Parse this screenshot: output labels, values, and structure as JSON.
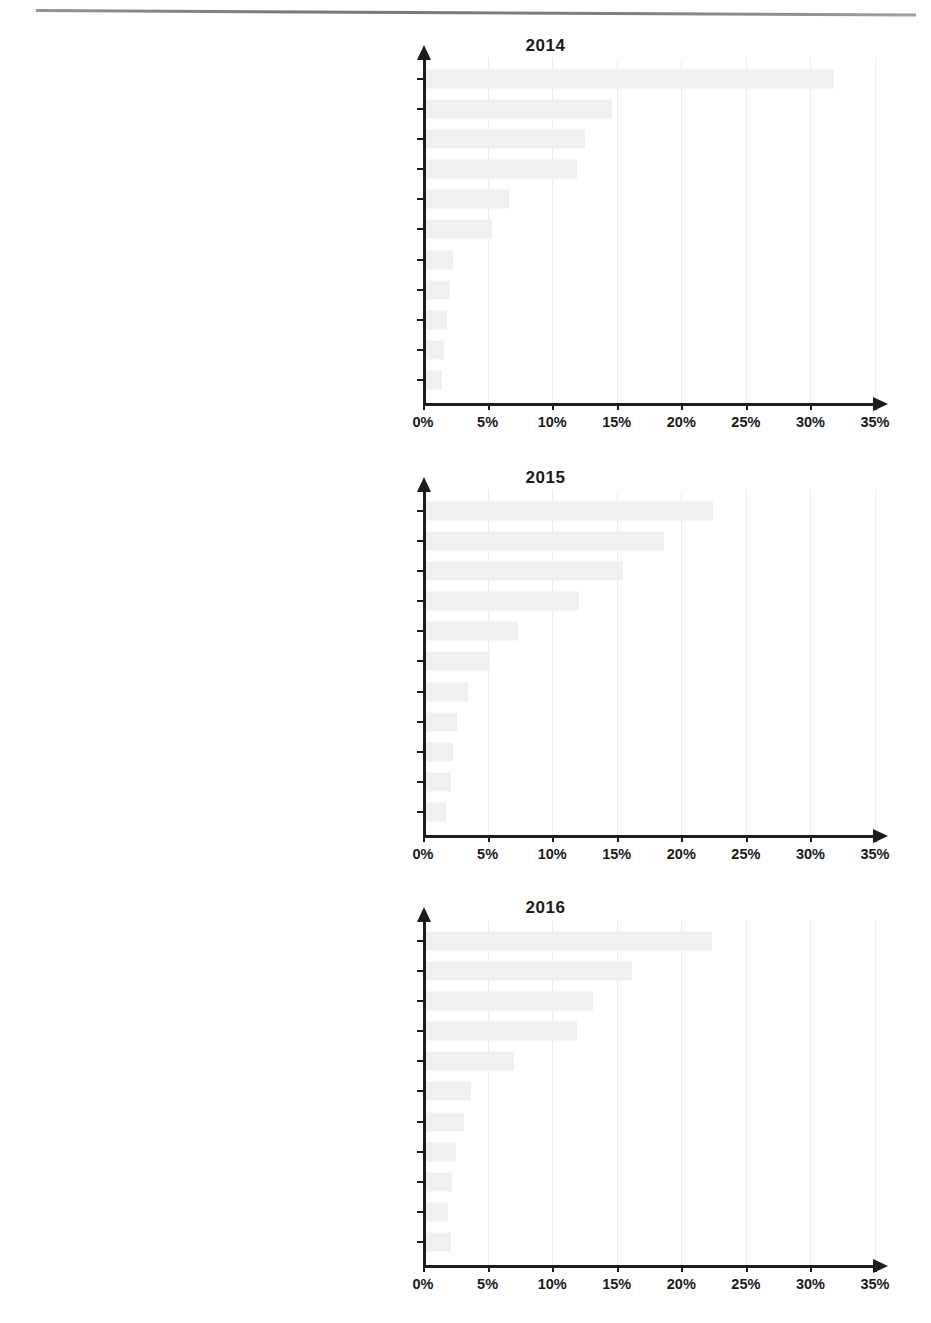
{
  "page": {
    "background_color": "#ffffff",
    "rule_color": "#7a7a7a"
  },
  "axis": {
    "tick_labels": [
      "0%",
      "5%",
      "10%",
      "15%",
      "20%",
      "25%",
      "30%",
      "35%"
    ],
    "tick_values": [
      0,
      5,
      10,
      15,
      20,
      25,
      30,
      35
    ],
    "xlim": [
      0,
      35
    ],
    "gridline_color": "#ececec",
    "bar_color": "#f0f0f0",
    "axis_color": "#1c1c1c"
  },
  "charts": [
    {
      "id": "chart-2014",
      "title": "2014",
      "categories": [
        "Footwear (64)",
        "Clothing, knitted or crocheted (61)",
        "Articles of leather(42)",
        "Electrical machinery and equipment (85)",
        "Optical, photographic and medical instruments (90)",
        "Watches (91)",
        "Perfumery and cosmetics (33)",
        "Toys (95)",
        "Jewellery (71)",
        "Machinery and mechanical appliances (84)",
        "Pharmaceutical products (30)"
      ],
      "values": [
        31.7,
        14.5,
        12.4,
        11.8,
        6.5,
        5.2,
        2.2,
        1.9,
        1.7,
        1.5,
        1.3
      ]
    },
    {
      "id": "chart-2015",
      "title": "2015",
      "categories": [
        "Footwear (64)",
        "Articles of leather(42)",
        "Clothing, knitted or crocheted (61)",
        "Electrical machinery and equipment (85)",
        "Watches (91)",
        "Optical, photographic and medical instruments (90)",
        "Perfumery and cosmetics (33)",
        "Toys (95)",
        "Pharmaceutical products (30)",
        "Headgear (65)",
        "Jewellery (71)"
      ],
      "values": [
        22.3,
        18.5,
        15.3,
        11.9,
        7.2,
        5.0,
        3.3,
        2.5,
        2.2,
        2.0,
        1.6
      ]
    },
    {
      "id": "chart-2016",
      "title": "2016",
      "categories": [
        "Footwear (64)",
        "Clothing, knitted or crocheted (61)",
        "Articles of leather(42)",
        "Electrical machinery and equipment (85)",
        "Watches (91)",
        "Optical, photographic and medical instruments (90)",
        "Perfumery and cosmetics (33)",
        "Toys (95)",
        "Jewellery (71)",
        "Pharmaceutical products (30)",
        "Headgear (65)"
      ],
      "values": [
        22.2,
        16.0,
        13.0,
        11.8,
        6.9,
        3.6,
        3.0,
        2.4,
        2.1,
        1.8,
        2.0
      ]
    }
  ],
  "chart_data": [
    {
      "type": "bar",
      "orientation": "horizontal",
      "title": "2014",
      "xlabel": "",
      "ylabel": "",
      "xlim": [
        0,
        35
      ],
      "grid": true,
      "legend": "none",
      "categories": [
        "Footwear (64)",
        "Clothing, knitted or crocheted (61)",
        "Articles of leather(42)",
        "Electrical machinery and equipment (85)",
        "Optical, photographic and medical instruments (90)",
        "Watches (91)",
        "Perfumery and cosmetics (33)",
        "Toys (95)",
        "Jewellery (71)",
        "Machinery and mechanical appliances (84)",
        "Pharmaceutical products (30)"
      ],
      "values": [
        31.7,
        14.5,
        12.4,
        11.8,
        6.5,
        5.2,
        2.2,
        1.9,
        1.7,
        1.5,
        1.3
      ],
      "tick_labels": [
        "0%",
        "5%",
        "10%",
        "15%",
        "20%",
        "25%",
        "30%",
        "35%"
      ]
    },
    {
      "type": "bar",
      "orientation": "horizontal",
      "title": "2015",
      "xlabel": "",
      "ylabel": "",
      "xlim": [
        0,
        35
      ],
      "grid": true,
      "legend": "none",
      "categories": [
        "Footwear (64)",
        "Articles of leather(42)",
        "Clothing, knitted or crocheted (61)",
        "Electrical machinery and equipment (85)",
        "Watches (91)",
        "Optical, photographic and medical instruments (90)",
        "Perfumery and cosmetics (33)",
        "Toys (95)",
        "Pharmaceutical products (30)",
        "Headgear (65)",
        "Jewellery (71)"
      ],
      "values": [
        22.3,
        18.5,
        15.3,
        11.9,
        7.2,
        5.0,
        3.3,
        2.5,
        2.2,
        2.0,
        1.6
      ],
      "tick_labels": [
        "0%",
        "5%",
        "10%",
        "15%",
        "20%",
        "25%",
        "30%",
        "35%"
      ]
    },
    {
      "type": "bar",
      "orientation": "horizontal",
      "title": "2016",
      "xlabel": "",
      "ylabel": "",
      "xlim": [
        0,
        35
      ],
      "grid": true,
      "legend": "none",
      "categories": [
        "Footwear (64)",
        "Clothing, knitted or crocheted (61)",
        "Articles of leather(42)",
        "Electrical machinery and equipment (85)",
        "Watches (91)",
        "Optical, photographic and medical instruments (90)",
        "Perfumery and cosmetics (33)",
        "Toys (95)",
        "Jewellery (71)",
        "Pharmaceutical products (30)",
        "Headgear (65)"
      ],
      "values": [
        22.2,
        16.0,
        13.0,
        11.8,
        6.9,
        3.6,
        3.0,
        2.4,
        2.1,
        1.8,
        2.0
      ],
      "tick_labels": [
        "0%",
        "5%",
        "10%",
        "15%",
        "20%",
        "25%",
        "30%",
        "35%"
      ]
    }
  ]
}
